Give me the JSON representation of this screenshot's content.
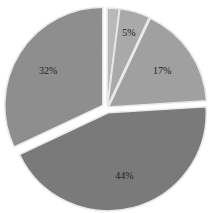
{
  "chart_data": {
    "type": "pie",
    "title": "",
    "categories": [
      "Slice A",
      "Slice B",
      "Slice C",
      "Slice D",
      "Slice E"
    ],
    "values": [
      2,
      5,
      17,
      44,
      32
    ],
    "labels": [
      "",
      "5%",
      "17%",
      "44%",
      "32%"
    ],
    "colors": [
      "#b9b9b9",
      "#a9a9a9",
      "#a0a0a0",
      "#7a7a7a",
      "#8e8e8e"
    ],
    "exploded": [
      false,
      false,
      false,
      true,
      true
    ],
    "start_angle_deg": 0,
    "direction": "clockwise",
    "legend": "none"
  }
}
